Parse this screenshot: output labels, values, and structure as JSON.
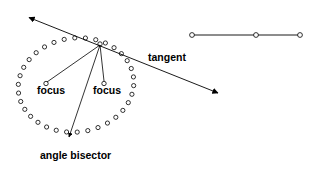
{
  "figure": {
    "background_color": "#ffffff",
    "stroke_color": "#000000",
    "width": 315,
    "height": 176
  },
  "labels": {
    "tangent": "tangent",
    "focus_left": "focus",
    "focus_right": "focus",
    "angle_bisector": "angle bisector"
  },
  "geometry": {
    "tangency_point": {
      "x": 100,
      "y": 44
    },
    "focus_left_point": {
      "x": 46,
      "y": 84
    },
    "focus_right_point": {
      "x": 104,
      "y": 84
    },
    "tangent_line": {
      "start": {
        "x": 26,
        "y": 16
      },
      "end": {
        "x": 222,
        "y": 95
      },
      "arrowheads": "both"
    },
    "angle_bisector_line": {
      "start": {
        "x": 100,
        "y": 44
      },
      "end": {
        "x": 68,
        "y": 140
      },
      "arrowheads": "end"
    },
    "ellipse": {
      "center_x": 76,
      "center_y": 85,
      "radius_x": 58,
      "radius_y": 47,
      "rotation_deg": -8,
      "marker_count": 34,
      "marker_style": "open-circle",
      "marker_radius": 2.1
    },
    "segment_markers": {
      "y": 35,
      "points": [
        {
          "x": 192,
          "y": 35
        },
        {
          "x": 256,
          "y": 35
        },
        {
          "x": 300,
          "y": 35
        }
      ],
      "marker_style": "open-circle",
      "marker_radius": 2.4
    }
  },
  "label_positions": {
    "tangent": {
      "x": 148,
      "y": 61
    },
    "focus_left": {
      "x": 37,
      "y": 94
    },
    "focus_right": {
      "x": 93,
      "y": 94
    },
    "angle_bisector": {
      "x": 40,
      "y": 159
    }
  }
}
